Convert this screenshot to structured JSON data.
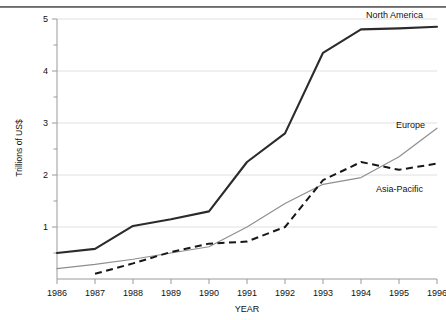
{
  "chart_data": {
    "type": "line",
    "title": "",
    "xlabel": "YEAR",
    "ylabel": "Trillions of US$",
    "x": [
      1986,
      1987,
      1988,
      1989,
      1990,
      1991,
      1992,
      1993,
      1994,
      1995,
      1996
    ],
    "categories": [
      "1986",
      "1987",
      "1988",
      "1989",
      "1990",
      "1991",
      "1992",
      "1993",
      "1994",
      "1995",
      "1996"
    ],
    "xlim": [
      1986,
      1996
    ],
    "ylim": [
      0,
      5
    ],
    "yticks": [
      1,
      2,
      3,
      4,
      5
    ],
    "ytick_labels": [
      "1",
      "2",
      "3",
      "4",
      "5"
    ],
    "minor_yticks": [
      0.5,
      1.5,
      2.5,
      3.5,
      4.5
    ],
    "grid": "horizontal",
    "legend_position": "inline-右 (labels placed at end of each line)",
    "series": [
      {
        "name": "North America",
        "style": "solid-thick-dark",
        "color": "#2b2b2b",
        "values": [
          0.5,
          0.58,
          1.02,
          1.15,
          1.3,
          2.25,
          2.8,
          4.35,
          4.8,
          4.82,
          4.85
        ]
      },
      {
        "name": "Europe",
        "style": "solid-thin-gray",
        "color": "#8e8e8e",
        "values": [
          0.2,
          0.28,
          0.38,
          0.5,
          0.62,
          1.0,
          1.45,
          1.82,
          1.95,
          2.35,
          2.9
        ]
      },
      {
        "name": "Asia-Pacific",
        "style": "dashed-black",
        "color": "#171717",
        "values": [
          null,
          0.1,
          0.3,
          0.52,
          0.68,
          0.72,
          1.0,
          1.9,
          2.25,
          2.1,
          2.22
        ]
      }
    ],
    "annotations": [
      {
        "text": "North America",
        "near_x": 1994,
        "near_y": 4.9
      },
      {
        "text": "Europe",
        "near_x": 1995,
        "near_y": 3.0
      },
      {
        "text": "Asia-Pacific",
        "near_x": 1995,
        "near_y": 1.75
      }
    ]
  }
}
